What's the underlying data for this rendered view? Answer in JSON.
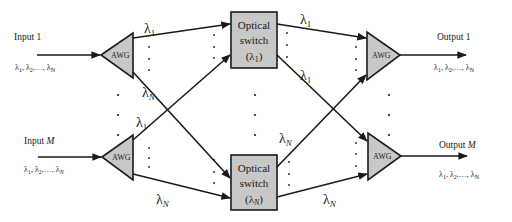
{
  "diagram": {
    "inputs": [
      {
        "title": "Input 1",
        "title_prefix": "Input",
        "title_index": "1",
        "wavelengths": "λ₁, λ₂,…, λN"
      },
      {
        "title": "Input M",
        "title_prefix": "Input",
        "title_index": "M",
        "wavelengths": "λ₁, λ₂,…, λN"
      }
    ],
    "outputs": [
      {
        "title": "Output 1",
        "title_prefix": "Output",
        "title_index": "1",
        "wavelengths": "λ₁, λ₂,…, λN"
      },
      {
        "title": "Output M",
        "title_prefix": "Output",
        "title_index": "M",
        "wavelengths": "λ₁, λ₂,…, λN"
      }
    ],
    "awg_label": "AWG",
    "switches": [
      {
        "line1": "Optical",
        "line2": "switch",
        "line3": "(λ1)",
        "lambda": "λ",
        "sub": "1"
      },
      {
        "line1": "Optical",
        "line2": "switch",
        "line3": "(λN)",
        "lambda": "λ",
        "sub": "N"
      }
    ],
    "wavelength_labels": {
      "lambda": "λ",
      "sub_1": "1",
      "sub_N": "N"
    },
    "colors": {
      "component_fill": "#c8c8c8",
      "stroke": "#1a1a1a",
      "background": "#ffffff"
    }
  }
}
